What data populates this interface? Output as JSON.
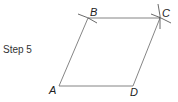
{
  "step": {
    "label": "Step 5"
  },
  "figure": {
    "shape": "parallelogram",
    "stroke_color": "#555555",
    "vertices": [
      {
        "name": "A",
        "x": 59,
        "y": 86
      },
      {
        "name": "B",
        "x": 88,
        "y": 18
      },
      {
        "name": "C",
        "x": 160,
        "y": 18
      },
      {
        "name": "D",
        "x": 133,
        "y": 86
      }
    ],
    "labels": {
      "A": "A",
      "B": "B",
      "C": "C",
      "D": "D"
    },
    "construction_marks": [
      "arc-at-B",
      "intersecting-arcs-at-C"
    ]
  }
}
